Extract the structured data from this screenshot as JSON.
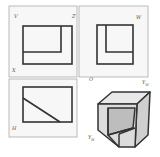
{
  "diagram": {
    "type": "three-view orthographic projection with isometric view",
    "colors": {
      "stroke": "#333333",
      "frame": "#999999",
      "panel_bg": "#f7f7f7",
      "face_light": "#e6e6e6",
      "face_mid": "#d0d0d0",
      "face_dark": "#bdbdbd"
    },
    "panels": [
      {
        "id": "front-view",
        "plane_label": "V",
        "corner_labels": [
          "V",
          "Z",
          "X"
        ]
      },
      {
        "id": "side-view",
        "plane_label": "W",
        "corner_labels": [
          "W"
        ]
      },
      {
        "id": "top-view",
        "plane_label": "H",
        "corner_labels": [
          "H"
        ]
      },
      {
        "id": "isometric-view",
        "corner_labels": [
          "O",
          "Y_W",
          "Y_H"
        ]
      }
    ],
    "labels": {
      "V": "V",
      "Z": "Z",
      "X": "X",
      "W": "W",
      "O": "O",
      "H": "H",
      "YW_main": "Y",
      "YW_sub": "W",
      "YH_main": "Y",
      "YH_sub": "H"
    }
  }
}
